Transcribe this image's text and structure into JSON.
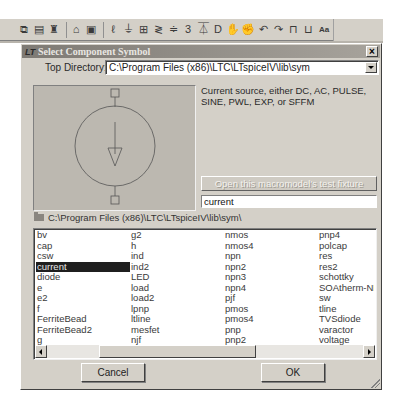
{
  "toolbar": {
    "icons": [
      {
        "name": "copy-icon",
        "glyph": "⧉"
      },
      {
        "name": "paste-icon",
        "glyph": "▤"
      },
      {
        "name": "find-icon",
        "glyph": "♜"
      },
      {
        "name": "print-setup-icon",
        "glyph": "⌂"
      },
      {
        "name": "print-icon",
        "glyph": "▣"
      },
      {
        "name": "wire-icon",
        "glyph": "ℓ"
      },
      {
        "name": "ground-icon",
        "glyph": "⏚"
      },
      {
        "name": "label-net-icon",
        "glyph": "⊞"
      },
      {
        "name": "resistor-icon",
        "glyph": "≷"
      },
      {
        "name": "capacitor-icon",
        "glyph": "≑"
      },
      {
        "name": "inductor-icon",
        "glyph": "3"
      },
      {
        "name": "diode-icon",
        "glyph": "⏄"
      },
      {
        "name": "component-icon",
        "glyph": "D"
      },
      {
        "name": "move-icon",
        "glyph": "✋"
      },
      {
        "name": "drag-icon",
        "glyph": "✊"
      },
      {
        "name": "undo-icon",
        "glyph": "↶"
      },
      {
        "name": "redo-icon",
        "glyph": "↷"
      },
      {
        "name": "rotate-icon",
        "glyph": "⊓"
      },
      {
        "name": "mirror-icon",
        "glyph": "⊔"
      },
      {
        "name": "text-icon",
        "glyph": "Aa"
      },
      {
        "name": "spice-directive-icon",
        "glyph": "op"
      }
    ]
  },
  "dialog": {
    "title": "Select Component Symbol",
    "title_icon": "LT",
    "close_label": "×",
    "top_directory": {
      "label": "Top Directory:",
      "value": "C:\\Program Files (x86)\\LTC\\LTspiceIV\\lib\\sym"
    },
    "description": "Current source, either DC, AC, PULSE, SINE, PWL, EXP, or SFFM",
    "macromodel_button": "Open this macromodel's test fixture",
    "component_name": "current",
    "current_path": "C:\\Program Files (x86)\\LTC\\LTspiceIV\\lib\\sym\\",
    "list": {
      "columns": [
        [
          "bv",
          "cap",
          "csw",
          "current",
          "diode",
          "e",
          "e2",
          "f",
          "FerriteBead",
          "FerriteBead2",
          "g"
        ],
        [
          "g2",
          "h",
          "ind",
          "ind2",
          "LED",
          "load",
          "load2",
          "lpnp",
          "ltline",
          "mesfet",
          "njf"
        ],
        [
          "nmos",
          "nmos4",
          "npn",
          "npn2",
          "npn3",
          "npn4",
          "pjf",
          "pmos",
          "pmos4",
          "pnp",
          "pnp2"
        ],
        [
          "pnp4",
          "polcap",
          "res",
          "res2",
          "schottky",
          "SOAtherm-NMOS",
          "sw",
          "tline",
          "TVSdiode",
          "varactor",
          "voltage"
        ]
      ],
      "selected": "current"
    },
    "cancel_label": "Cancel",
    "ok_label": "OK"
  },
  "colors": {
    "dialog_bg": "#d4d0c8",
    "titlebar": "#8a867f",
    "preview_bg": "#bcb8b0",
    "selection": "#1f1f1f"
  }
}
